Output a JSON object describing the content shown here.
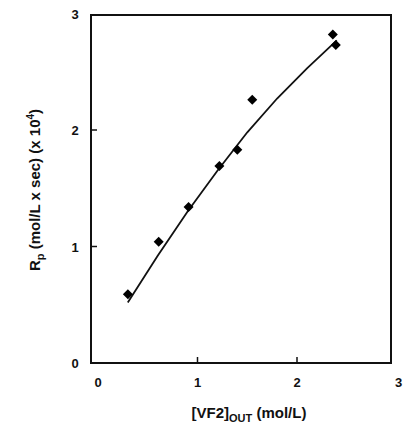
{
  "chart_data": {
    "type": "scatter",
    "title": "",
    "xlabel": "[VF2]OUT (mol/L)",
    "xlabel_parts": {
      "main": "[VF2]",
      "sub": "OUT",
      "rest": " (mol/L)"
    },
    "ylabel": "Rp (mol/L x sec) (x 10^4)",
    "ylabel_parts": {
      "main": "R",
      "sub": "p",
      "rest": " (mol/L x sec) (x 10",
      "sup": "4",
      "end": ")"
    },
    "xlim": [
      0,
      3
    ],
    "ylim": [
      0,
      3
    ],
    "xticks": [
      "0",
      "1",
      "2",
      "3"
    ],
    "yticks": [
      "0",
      "1",
      "2",
      "3"
    ],
    "grid": false,
    "legend": null,
    "series": [
      {
        "name": "experimental",
        "marker": "diamond",
        "color": "#000000",
        "x": [
          0.3,
          0.61,
          0.91,
          1.22,
          1.4,
          1.55,
          2.36,
          2.39
        ],
        "y": [
          0.59,
          1.04,
          1.34,
          1.69,
          1.83,
          2.26,
          2.82,
          2.73
        ]
      },
      {
        "name": "fit",
        "style": "line",
        "color": "#000000",
        "x": [
          0.3,
          0.6,
          0.9,
          1.2,
          1.5,
          1.8,
          2.1,
          2.4
        ],
        "y": [
          0.52,
          0.92,
          1.3,
          1.65,
          1.98,
          2.27,
          2.53,
          2.77
        ]
      }
    ]
  }
}
